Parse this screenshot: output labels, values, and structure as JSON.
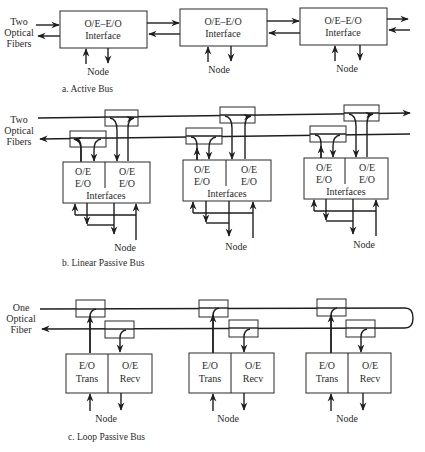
{
  "figure": {
    "panels": [
      {
        "id": "a",
        "caption": "a.  Active Bus",
        "fiber_label_lines": [
          "Two",
          "Optical",
          "Fibers"
        ],
        "nodes": [
          {
            "box_line1": "O/E–E/O",
            "box_line2": "Interface",
            "node_label": "Node"
          },
          {
            "box_line1": "O/E–E/O",
            "box_line2": "Interface",
            "node_label": "Node"
          },
          {
            "box_line1": "O/E–E/O",
            "box_line2": "Interface",
            "node_label": "Node"
          }
        ]
      },
      {
        "id": "b",
        "caption": "b.  Linear Passive Bus",
        "fiber_label_lines": [
          "Two",
          "Optical",
          "Fibers"
        ],
        "nodes": [
          {
            "left_top": "O/E",
            "left_bottom": "E/O",
            "right_top": "O/E",
            "right_bottom": "E/O",
            "box_label": "Interfaces",
            "node_label": "Node"
          },
          {
            "left_top": "O/E",
            "left_bottom": "E/O",
            "right_top": "O/E",
            "right_bottom": "E/O",
            "box_label": "Interfaces",
            "node_label": "Node"
          },
          {
            "left_top": "O/E",
            "left_bottom": "E/O",
            "right_top": "O/E",
            "right_bottom": "E/O",
            "box_label": "Interfaces",
            "node_label": "Node"
          }
        ]
      },
      {
        "id": "c",
        "caption": "c.  Loop Passive Bus",
        "fiber_label_lines": [
          "One",
          "Optical",
          "Fiber"
        ],
        "nodes": [
          {
            "left_top": "E/O",
            "left_bottom": "Trans",
            "right_top": "O/E",
            "right_bottom": "Recv",
            "node_label": "Node"
          },
          {
            "left_top": "E/O",
            "left_bottom": "Trans",
            "right_top": "O/E",
            "right_bottom": "Recv",
            "node_label": "Node"
          },
          {
            "left_top": "E/O",
            "left_bottom": "Trans",
            "right_top": "O/E",
            "right_bottom": "Recv",
            "node_label": "Node"
          }
        ]
      }
    ]
  }
}
